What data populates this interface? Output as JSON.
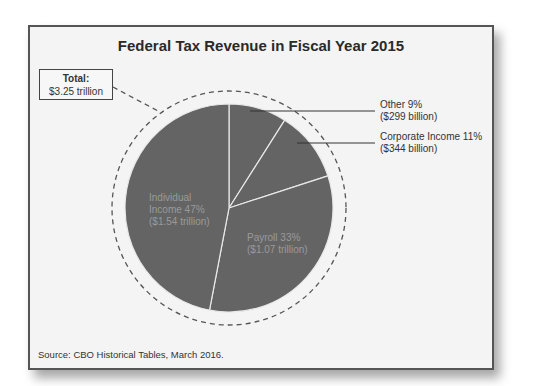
{
  "chart_data": {
    "type": "pie",
    "title": "Federal Tax Revenue in Fiscal Year 2015",
    "total": {
      "label": "Total:",
      "value": "$3.25 trillion"
    },
    "categories": [
      "Individual Income",
      "Payroll",
      "Corporate Income",
      "Other"
    ],
    "values": [
      47,
      33,
      11,
      9
    ],
    "amounts": [
      "$1.54 trillion",
      "$1.07 trillion",
      "$344 billion",
      "$299 billion"
    ],
    "slices": [
      {
        "name": "Other",
        "percent": 9,
        "label": "Other 9%",
        "amount": "($299 billion)"
      },
      {
        "name": "Corporate Income",
        "percent": 11,
        "label": "Corporate Income 11%",
        "amount": "($344 billion)"
      },
      {
        "name": "Payroll",
        "percent": 33,
        "label": "Payroll 33%",
        "amount": "($1.07 trillion)"
      },
      {
        "name": "Individual Income",
        "percent": 47,
        "label": "Individual",
        "label2": "Income 47%",
        "amount": "($1.54 trillion)"
      }
    ],
    "source": "Source: CBO Historical Tables, March 2016.",
    "legend": "none (direct labels)"
  },
  "colors": {
    "slice": "#646464",
    "separator": "#e8e8e8",
    "background": "#f4f4f4",
    "frame": "#555555"
  }
}
